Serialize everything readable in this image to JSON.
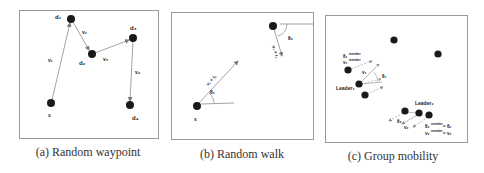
{
  "figure": {
    "panels": [
      {
        "id": "a",
        "caption": "(a) Random waypoint",
        "nodes": [
          {
            "name": "s",
            "label": "s",
            "x": 51,
            "y": 103
          },
          {
            "name": "d1",
            "label": "d₁",
            "x": 71,
            "y": 19
          },
          {
            "name": "d2",
            "label": "d₂",
            "x": 92,
            "y": 54
          },
          {
            "name": "d3",
            "label": "d₃",
            "x": 133,
            "y": 38
          },
          {
            "name": "d4",
            "label": "d₄",
            "x": 130,
            "y": 105
          }
        ],
        "edges": [
          {
            "from": "s",
            "to": "d1",
            "label": "v₁"
          },
          {
            "from": "d1",
            "to": "d2",
            "label": "v₂"
          },
          {
            "from": "d2",
            "to": "d3",
            "label": "v₃"
          },
          {
            "from": "d3",
            "to": "d4",
            "label": "v₄"
          }
        ]
      },
      {
        "id": "b",
        "caption": "(b) Random walk",
        "nodes": [
          {
            "name": "s",
            "label": "s",
            "x": 197,
            "y": 106
          },
          {
            "name": "n2",
            "label": "",
            "x": 273,
            "y": 26
          }
        ],
        "steps": [
          {
            "label": "v₁ × t₁",
            "angle_label": "θ₁"
          },
          {
            "label": "v₂ × t₂",
            "angle_label": "θ₂"
          }
        ]
      },
      {
        "id": "c",
        "caption": "(c) Group mobility",
        "labels": {
          "leader1": "Leader₁",
          "leader2": "Leader₂",
          "theta1_member": "θ₁",
          "v1_member": "v₁",
          "member_sup": "member",
          "v1": "v₁",
          "theta1": "θ₁",
          "theta2": "θ₂",
          "v2": "v₂",
          "theta2_member_eq": "= θ₂",
          "v2_member_eq": "= v₂",
          "theta2_member": "θ₂",
          "v2_member": "v₂"
        }
      }
    ]
  },
  "colors": {
    "node": "#1a1a1a",
    "line": "#8a8a8a",
    "border": "#9a9a9a",
    "text": "#222222"
  }
}
